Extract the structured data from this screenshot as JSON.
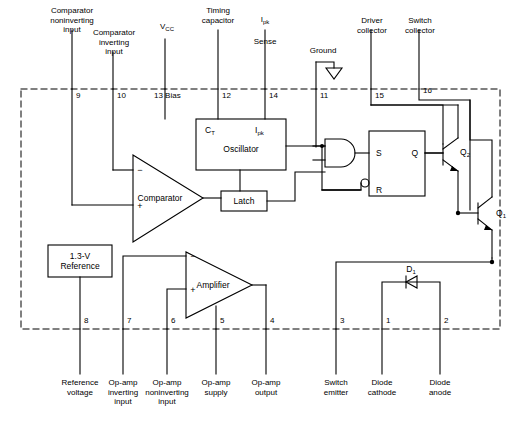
{
  "diagram": {
    "line_color": "#000000",
    "background": "#ffffff",
    "boundary_style": "dashed"
  },
  "top_terminals": [
    {
      "pin": "9",
      "label": "Comparator\nnoninverting\ninput"
    },
    {
      "pin": "10",
      "label": "Comparator\ninverting\ninput"
    },
    {
      "pin": "13 Bias",
      "label": "Vcc"
    },
    {
      "pin": "12",
      "label": "Timing\ncapacitor"
    },
    {
      "pin": "14",
      "label": "Sense"
    },
    {
      "pin": "11",
      "label": "Ground"
    },
    {
      "pin": "15",
      "label": "Driver\ncollector"
    },
    {
      "pin": "16",
      "label": "Switch\ncollector"
    }
  ],
  "bottom_terminals": [
    {
      "pin": "8",
      "label": "Reference\nvoltage"
    },
    {
      "pin": "7",
      "label": "Op-amp\ninverting\ninput"
    },
    {
      "pin": "6",
      "label": "Op-amp\nnoninverting\ninput"
    },
    {
      "pin": "5",
      "label": "Op-amp\nsupply"
    },
    {
      "pin": "4",
      "label": "Op-amp\noutput"
    },
    {
      "pin": "3",
      "label": "Switch\nemitter"
    },
    {
      "pin": "1",
      "label": "Diode\ncathode"
    },
    {
      "pin": "2",
      "label": "Diode\nanode"
    }
  ],
  "labels": {
    "vcc": "V",
    "vcc_sub": "CC",
    "ipk_main": "I",
    "ipk_sub": "pk",
    "ipk_sense": "Sense",
    "ground": "Ground"
  },
  "blocks": {
    "oscillator": {
      "name": "Oscillator",
      "input_ct": "C",
      "input_ct_sub": "T",
      "input_ipk": "I",
      "input_ipk_sub": "pk"
    },
    "comparator": {
      "name": "Comparator",
      "minus": "−",
      "plus": "+"
    },
    "amplifier": {
      "name": "Amplifier",
      "minus": "−",
      "plus": "+"
    },
    "latch": {
      "name": "Latch"
    },
    "reference": {
      "name": "1.3-V\nReference"
    },
    "flipflop": {
      "set": "S",
      "reset": "R",
      "q": "Q"
    },
    "and_gate": {
      "name": "AND"
    }
  },
  "components": {
    "transistor_q2": {
      "label": "Q",
      "sub": "2"
    },
    "transistor_q1": {
      "label": "Q",
      "sub": "1"
    },
    "diode_d1": {
      "label": "D",
      "sub": "1"
    }
  }
}
